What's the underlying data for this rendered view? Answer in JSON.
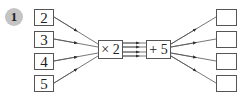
{
  "question_number": "1",
  "inputs": [
    "2",
    "3",
    "4",
    "5"
  ],
  "operations": [
    {
      "label": "× 2"
    },
    {
      "label": "+ 5"
    }
  ],
  "outputs": [
    "",
    "",
    "",
    ""
  ],
  "colors": {
    "badge": "#c4c4c4",
    "line": "#555555"
  }
}
